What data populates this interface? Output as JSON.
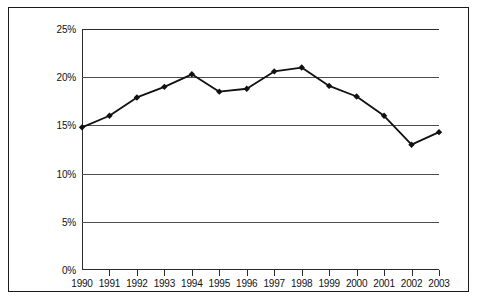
{
  "chart_data": {
    "type": "line",
    "title": "",
    "subtitle": "",
    "xlabel": "",
    "ylabel": "",
    "categories": [
      "1990",
      "1991",
      "1992",
      "1993",
      "1994",
      "1995",
      "1996",
      "1997",
      "1998",
      "1999",
      "2000",
      "2001",
      "2002",
      "2003"
    ],
    "values": [
      14.8,
      16.0,
      17.9,
      19.0,
      20.3,
      18.5,
      18.8,
      20.6,
      21.0,
      19.1,
      18.0,
      16.0,
      13.0,
      14.3
    ],
    "series": [
      {
        "name": "",
        "values": [
          14.8,
          16.0,
          17.9,
          19.0,
          20.3,
          18.5,
          18.8,
          20.6,
          21.0,
          19.1,
          18.0,
          16.0,
          13.0,
          14.3
        ]
      }
    ],
    "ylim": [
      0,
      25
    ],
    "ytick_values": [
      0,
      5,
      10,
      15,
      20,
      25
    ],
    "ytick_labels": [
      "0%",
      "5%",
      "10%",
      "15%",
      "20%",
      "25%"
    ],
    "xtick_labels": [
      "1990",
      "1991",
      "1992",
      "1993",
      "1994",
      "1995",
      "1996",
      "1997",
      "1998",
      "1999",
      "2000",
      "2001",
      "2002",
      "2003"
    ],
    "grid": "horizontal",
    "legend": "none",
    "line_color": "#111111",
    "marker": "diamond",
    "marker_color": "#111111",
    "background_color": "#ffffff",
    "frame_color": "#1a1a1a",
    "annotations": []
  },
  "axes": {
    "y_labels": [
      "25%",
      "20%",
      "15%",
      "10%",
      "5%",
      "0%"
    ],
    "x_labels": [
      "1990",
      "1991",
      "1992",
      "1993",
      "1994",
      "1995",
      "1996",
      "1997",
      "1998",
      "1999",
      "2000",
      "2001",
      "2002",
      "2003"
    ]
  }
}
